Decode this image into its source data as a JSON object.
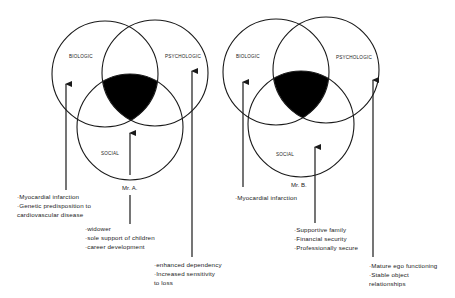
{
  "diagram": {
    "colors": {
      "stroke": "#1a1a1a",
      "fill_intersection": "#000000",
      "background": "#ffffff"
    },
    "panels": [
      {
        "patient": "Mr. A.",
        "circles": {
          "biologic": "BIOLOGIC",
          "psychologic": "PSYCHOLOGIC",
          "social": "SOCIAL"
        },
        "biologic_factors": [
          "·Myocardial infarction",
          "·Genetic predisposition to",
          " cardiovascular disease"
        ],
        "social_factors": [
          "·widower",
          "·sole support of children",
          "·career development"
        ],
        "psychologic_factors": [
          "·enhanced dependency",
          "·Increased sensitivity",
          " to loss"
        ]
      },
      {
        "patient": "Mr. B.",
        "circles": {
          "biologic": "BIOLOGIC",
          "psychologic": "PSYCHOLOGIC",
          "social": "SOCIAL"
        },
        "biologic_factors": [
          "·Myocardial infarction"
        ],
        "social_factors": [
          "·Supportive family",
          "·Financial security",
          "·Professionally secure"
        ],
        "psychologic_factors": [
          "·Mature ego functioning",
          "·Stable object",
          " relationships"
        ]
      }
    ]
  }
}
